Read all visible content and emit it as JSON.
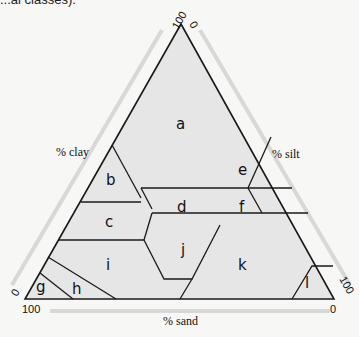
{
  "top_text": "...al classes).",
  "diagram": {
    "type": "ternary soil texture triangle",
    "axes": {
      "clay": {
        "label": "% clay",
        "start_tick": "0",
        "end_tick": "100"
      },
      "silt": {
        "label": "% silt",
        "start_tick": "0",
        "end_tick": "100"
      },
      "sand": {
        "label": "% sand",
        "start_tick": "0",
        "end_tick": "100"
      }
    },
    "regions": [
      "a",
      "b",
      "c",
      "d",
      "e",
      "f",
      "g",
      "h",
      "i",
      "j",
      "k",
      "l"
    ],
    "colors": {
      "fill": "#e6e6e6",
      "line": "#1a1a1a",
      "background": "#f7f7f5"
    }
  }
}
